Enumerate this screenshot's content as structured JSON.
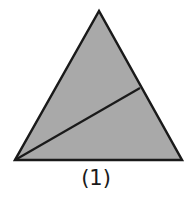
{
  "figure": {
    "label": "(1)",
    "shape": "triangle",
    "fill_color": "#a9a9a9",
    "stroke_color": "#1a1a1a",
    "vertices": {
      "top": [
        99,
        11
      ],
      "bottom_left": [
        15,
        160
      ],
      "bottom_right": [
        182,
        160
      ]
    },
    "dividing_line": {
      "from": [
        15,
        160
      ],
      "to": [
        140,
        88
      ]
    }
  }
}
